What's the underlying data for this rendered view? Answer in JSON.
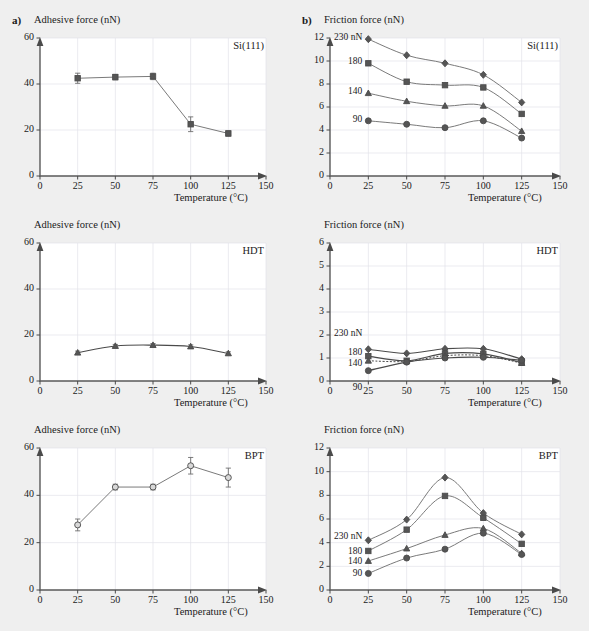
{
  "figure": {
    "background_color": "#efefef",
    "plot_background_color": "#ffffff",
    "panels": [
      {
        "key": "a",
        "label": "a)"
      },
      {
        "key": "b",
        "label": "b)"
      }
    ]
  },
  "axis_titles": {
    "adhesive": "Adhesive force (nN)",
    "friction": "Friction force (nN)",
    "temperature": "Temperature (°C)"
  },
  "sample_labels": {
    "si": "Si(111)",
    "hdt": "HDT",
    "bpt": "BPT"
  },
  "legend": {
    "entries": [
      {
        "label": "230 nN",
        "marker": "diamond",
        "load": 230
      },
      {
        "label": "180",
        "marker": "square",
        "load": 180
      },
      {
        "label": "140",
        "marker": "triangle",
        "load": 140
      },
      {
        "label": "90",
        "marker": "circle",
        "load": 90
      }
    ]
  },
  "axes": {
    "x": {
      "min": 0,
      "max": 150,
      "ticks": [
        0,
        25,
        50,
        75,
        100,
        125,
        150
      ],
      "label": "Temperature (°C)"
    },
    "y_adhesive": {
      "min": 0,
      "max": 60,
      "ticks": [
        0,
        20,
        40,
        60
      ],
      "label": "Adhesive force (nN)"
    },
    "y_friction_12": {
      "min": 0,
      "max": 12,
      "ticks": [
        0,
        2,
        4,
        6,
        8,
        10,
        12
      ],
      "label": "Friction force (nN)"
    },
    "y_friction_6": {
      "min": 0,
      "max": 6,
      "ticks": [
        0,
        1,
        2,
        3,
        4,
        5,
        6
      ],
      "label": "Friction force (nN)"
    }
  },
  "chart_data": [
    {
      "id": "a-si",
      "type": "line",
      "title": "Si(111)",
      "panel": "a)",
      "xlabel": "Temperature (°C)",
      "ylabel": "Adhesive force (nN)",
      "xlim": [
        0,
        150
      ],
      "ylim": [
        0,
        60
      ],
      "xticks": [
        0,
        25,
        50,
        75,
        100,
        125,
        150
      ],
      "yticks": [
        0,
        20,
        40,
        60
      ],
      "grid": true,
      "marker": "square",
      "x": [
        25,
        50,
        75,
        100,
        125
      ],
      "values": [
        42.5,
        43.0,
        43.3,
        22.5,
        18.5
      ],
      "errors": [
        2.2,
        1.2,
        1.4,
        3.2,
        1.2
      ]
    },
    {
      "id": "a-hdt",
      "type": "line",
      "title": "HDT",
      "panel": "a)",
      "xlabel": "Temperature (°C)",
      "ylabel": "Adhesive force (nN)",
      "xlim": [
        0,
        150
      ],
      "ylim": [
        0,
        60
      ],
      "xticks": [
        0,
        25,
        50,
        75,
        100,
        125,
        150
      ],
      "yticks": [
        0,
        20,
        40,
        60
      ],
      "grid": true,
      "marker": "triangle",
      "x": [
        25,
        50,
        75,
        100,
        125
      ],
      "values": [
        12.3,
        15.2,
        15.6,
        15.0,
        12.0
      ],
      "errors": [
        0.7,
        0.7,
        0.7,
        0.7,
        0.7
      ]
    },
    {
      "id": "a-bpt",
      "type": "line",
      "title": "BPT",
      "panel": "a)",
      "xlabel": "Temperature (°C)",
      "ylabel": "Adhesive force (nN)",
      "xlim": [
        0,
        150
      ],
      "ylim": [
        0,
        60
      ],
      "xticks": [
        0,
        25,
        50,
        75,
        100,
        125,
        150
      ],
      "yticks": [
        0,
        20,
        40,
        60
      ],
      "grid": true,
      "marker": "circle",
      "x": [
        25,
        50,
        75,
        100,
        125
      ],
      "values": [
        27.5,
        43.5,
        43.5,
        52.5,
        47.5
      ],
      "errors": [
        2.5,
        1.2,
        1.2,
        3.5,
        4.0
      ]
    },
    {
      "id": "b-si",
      "type": "line",
      "title": "Si(111)",
      "panel": "b)",
      "xlabel": "Temperature (°C)",
      "ylabel": "Friction force (nN)",
      "xlim": [
        0,
        150
      ],
      "ylim": [
        0,
        12
      ],
      "xticks": [
        0,
        25,
        50,
        75,
        100,
        125,
        150
      ],
      "yticks": [
        0,
        2,
        4,
        6,
        8,
        10,
        12
      ],
      "grid": true,
      "x": [
        25,
        50,
        75,
        100,
        125
      ],
      "series": [
        {
          "name": "230 nN",
          "marker": "diamond",
          "values": [
            11.9,
            10.5,
            9.8,
            8.8,
            6.4
          ]
        },
        {
          "name": "180",
          "marker": "square",
          "values": [
            9.8,
            8.2,
            7.9,
            7.7,
            5.4
          ]
        },
        {
          "name": "140",
          "marker": "triangle",
          "values": [
            7.2,
            6.5,
            6.1,
            6.1,
            3.9
          ]
        },
        {
          "name": "90",
          "marker": "circle",
          "values": [
            4.8,
            4.5,
            4.2,
            4.8,
            3.3
          ]
        }
      ]
    },
    {
      "id": "b-hdt",
      "type": "line",
      "title": "HDT",
      "panel": "b)",
      "xlabel": "Temperature (°C)",
      "ylabel": "Friction force (nN)",
      "xlim": [
        0,
        150
      ],
      "ylim": [
        0,
        6
      ],
      "xticks": [
        0,
        25,
        50,
        75,
        100,
        125,
        150
      ],
      "yticks": [
        0,
        1,
        2,
        3,
        4,
        5,
        6
      ],
      "grid": true,
      "x": [
        25,
        50,
        75,
        100,
        125
      ],
      "series": [
        {
          "name": "230 nN",
          "marker": "diamond",
          "values": [
            1.38,
            1.2,
            1.4,
            1.4,
            0.95
          ]
        },
        {
          "name": "180",
          "marker": "square",
          "values": [
            1.08,
            0.88,
            1.2,
            1.18,
            0.8
          ]
        },
        {
          "name": "140",
          "marker": "triangle",
          "values": [
            0.88,
            0.85,
            1.1,
            1.1,
            0.78
          ]
        },
        {
          "name": "90",
          "marker": "circle",
          "values": [
            0.45,
            0.82,
            1.0,
            1.03,
            0.9
          ]
        }
      ]
    },
    {
      "id": "b-bpt",
      "type": "line",
      "title": "BPT",
      "panel": "b)",
      "xlabel": "Temperature (°C)",
      "ylabel": "Friction force (nN)",
      "xlim": [
        0,
        150
      ],
      "ylim": [
        0,
        12
      ],
      "xticks": [
        0,
        25,
        50,
        75,
        100,
        125,
        150
      ],
      "yticks": [
        0,
        2,
        4,
        6,
        8,
        10,
        12
      ],
      "grid": true,
      "x": [
        25,
        50,
        75,
        100,
        125
      ],
      "series": [
        {
          "name": "230 nN",
          "marker": "diamond",
          "values": [
            4.2,
            5.95,
            9.5,
            6.5,
            4.7
          ]
        },
        {
          "name": "180",
          "marker": "square",
          "values": [
            3.3,
            5.1,
            7.95,
            6.1,
            3.9
          ]
        },
        {
          "name": "140",
          "marker": "triangle",
          "values": [
            2.45,
            3.5,
            4.65,
            5.2,
            3.1
          ]
        },
        {
          "name": "90",
          "marker": "circle",
          "values": [
            1.4,
            2.7,
            3.45,
            4.8,
            3.0
          ]
        }
      ]
    }
  ]
}
